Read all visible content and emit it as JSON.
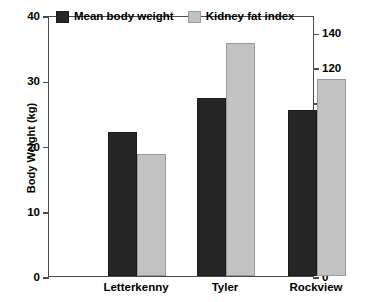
{
  "chart_data": {
    "type": "bar",
    "title": "",
    "categories": [
      "Letterkenny",
      "Tyler",
      "Rockview"
    ],
    "series": [
      {
        "name": "Mean body weight",
        "axis": "left",
        "color": "#262626",
        "values": [
          22.0,
          27.3,
          25.4
        ]
      },
      {
        "name": "Kidney fat index",
        "axis": "right",
        "color": "#c2c2c2",
        "values": [
          70,
          134,
          113
        ]
      }
    ],
    "xlabel": "",
    "ylabel": "Body Weight (kg)",
    "y2label": "Kidney Fat Index",
    "ylim": [
      0,
      40
    ],
    "y2lim": [
      0,
      150
    ],
    "yticks": [
      0,
      10,
      20,
      30,
      40
    ],
    "y2ticks": [
      0,
      20,
      40,
      60,
      80,
      100,
      120,
      140
    ],
    "ytick_labels": [
      "0",
      "10",
      "20",
      "30",
      "40"
    ],
    "y2tick_labels": [
      "0",
      "20",
      "40",
      "60",
      "80",
      "100",
      "120",
      "140"
    ],
    "grid": false,
    "legend_position": "top-inside-left"
  },
  "axes": {
    "left_title": "Body Weight (kg)",
    "right_title": "Kidney Fat Index"
  },
  "legend": {
    "entries": [
      {
        "label": "Mean body weight",
        "swatch": "dark"
      },
      {
        "label": "Kidney fat index",
        "swatch": "light"
      }
    ]
  }
}
